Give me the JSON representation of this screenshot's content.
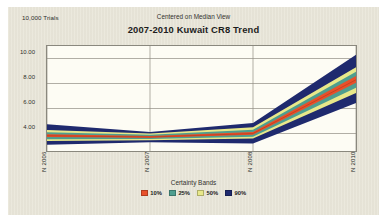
{
  "header": {
    "trials_label": "10,000 Trials",
    "subtitle": "Centered on Median View",
    "title": "2007-2010 Kuwait CR8 Trend"
  },
  "legend": {
    "title": "Certainty Bands",
    "entries": [
      {
        "label": "10%",
        "color": "#e8502a"
      },
      {
        "label": "25%",
        "color": "#4e9e8f"
      },
      {
        "label": "50%",
        "color": "#e8e88a"
      },
      {
        "label": "90%",
        "color": "#1f2a6e"
      }
    ]
  },
  "axes": {
    "y_ticks": [
      "10.00",
      "8.00",
      "6.00",
      "4.00"
    ],
    "y_values": [
      10,
      8,
      6,
      4
    ],
    "x_ticks": [
      "N 2006",
      "N 2007",
      "N 2008",
      "N 2010"
    ]
  },
  "chart_data": {
    "type": "area",
    "title": "2007-2010 Kuwait CR8 Trend",
    "subtitle": "Centered on Median View",
    "xlabel": "",
    "ylabel": "",
    "grid": true,
    "legend_position": "bottom",
    "legend_title": "Certainty Bands",
    "categories": [
      "N 2006",
      "N 2007",
      "N 2008",
      "N 2010"
    ],
    "x": [
      0,
      1,
      2,
      3
    ],
    "ylim": [
      2.6,
      11.0
    ],
    "y_ticks": [
      4,
      6,
      8,
      10
    ],
    "median": [
      3.82,
      3.72,
      4.0,
      8.3
    ],
    "bands": [
      {
        "name": "10%",
        "color": "#e8502a",
        "lower": [
          3.72,
          3.66,
          3.9,
          8.05
        ],
        "upper": [
          3.95,
          3.8,
          4.12,
          8.6
        ]
      },
      {
        "name": "25%",
        "color": "#4e9e8f",
        "lower": [
          3.55,
          3.56,
          3.75,
          7.65
        ],
        "upper": [
          4.1,
          3.9,
          4.3,
          8.95
        ]
      },
      {
        "name": "50%",
        "color": "#e8e88a",
        "lower": [
          3.4,
          3.46,
          3.6,
          7.25
        ],
        "upper": [
          4.28,
          4.0,
          4.5,
          9.3
        ]
      },
      {
        "name": "90%",
        "color": "#1f2a6e",
        "lower": [
          3.1,
          3.3,
          3.2,
          6.45
        ],
        "upper": [
          4.75,
          4.12,
          4.85,
          10.3
        ]
      }
    ]
  }
}
